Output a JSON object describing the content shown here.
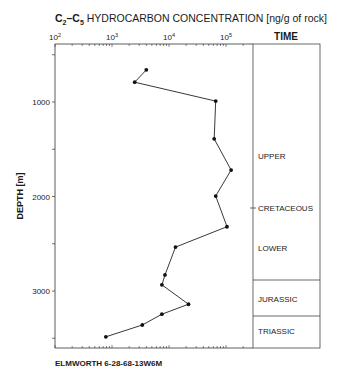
{
  "chart_data": {
    "type": "line",
    "title": "C2–C5 HYDROCARBON CONCENTRATION [ng/g of rock]",
    "title_parts": {
      "pre": "C",
      "sub1": "2",
      "mid": "–C",
      "sub2": "5",
      "post": " HYDROCARBON  CONCENTRATION  [ng/g of rock]"
    },
    "xlabel": "C2–C5 HYDROCARBON CONCENTRATION [ng/g of rock]",
    "ylabel": "DEPTH [m]",
    "x_scale": "log",
    "xlim": [
      100,
      500000
    ],
    "ylim": [
      3600,
      385
    ],
    "x_ticks": [
      {
        "value": 100,
        "base": "10",
        "exp": "2"
      },
      {
        "value": 1000,
        "base": "10",
        "exp": "3"
      },
      {
        "value": 10000,
        "base": "10",
        "exp": "4"
      },
      {
        "value": 100000,
        "base": "10",
        "exp": "5"
      }
    ],
    "y_ticks": [
      1000,
      2000,
      3000
    ],
    "grid": false,
    "legend": null,
    "series": [
      {
        "name": "Elmworth 6-28-68-13W6M",
        "points": [
          {
            "x": 4000,
            "y": 660
          },
          {
            "x": 2500,
            "y": 790
          },
          {
            "x": 66000,
            "y": 990
          },
          {
            "x": 62000,
            "y": 1390
          },
          {
            "x": 123000,
            "y": 1720
          },
          {
            "x": 66000,
            "y": 1995
          },
          {
            "x": 104000,
            "y": 2320
          },
          {
            "x": 13000,
            "y": 2535
          },
          {
            "x": 8500,
            "y": 2830
          },
          {
            "x": 7500,
            "y": 2935
          },
          {
            "x": 22000,
            "y": 3140
          },
          {
            "x": 7500,
            "y": 3245
          },
          {
            "x": 3400,
            "y": 3360
          },
          {
            "x": 780,
            "y": 3485
          }
        ]
      }
    ],
    "time_column": {
      "header": "TIME",
      "units": [
        {
          "label": "UPPER",
          "depth_label": 1600
        },
        {
          "label": "CRETACEOUS",
          "depth_label": 2130,
          "tick": true
        },
        {
          "label": "LOWER",
          "depth_label": 2560
        },
        {
          "label": "JURASSIC",
          "from": 2895,
          "to": 3265
        },
        {
          "label": "TRIASSIC",
          "from": 3265,
          "to": 3600
        }
      ],
      "boundaries": [
        2895,
        3265
      ]
    },
    "caption": "ELMWORTH 6-28-68-13W6M"
  }
}
